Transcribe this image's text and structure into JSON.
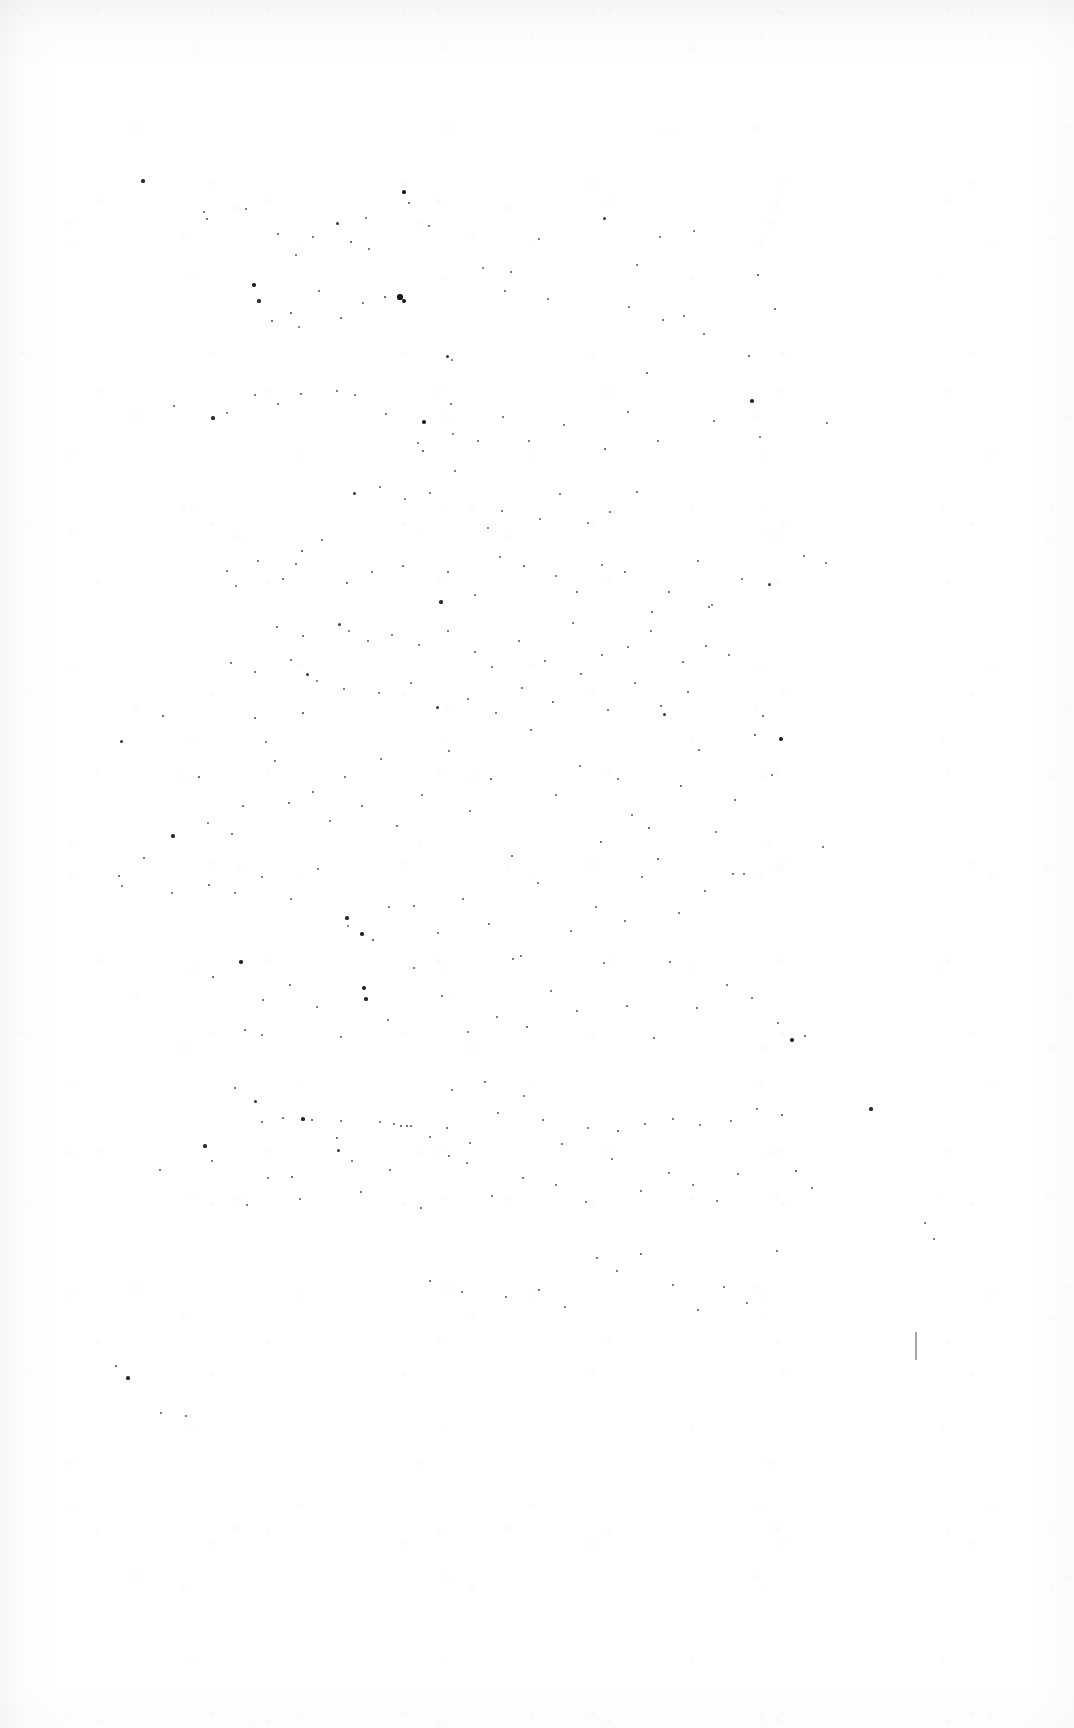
{
  "document": {
    "kind": "scanned-page",
    "title": "Blank scanned page",
    "page_width": 1074,
    "page_height": 1728,
    "background_color": "#ffffff",
    "paper_tone_color": "#f7f7f8",
    "speck_color": "#1a1a1a",
    "visible_text": "",
    "body_text": "",
    "header_text": "",
    "footer_text": "",
    "page_number": "",
    "notes": "No legible printed text, headings, figures or captions are present in the pixels; only scanner dust specks and faint paper tone."
  },
  "artifacts": {
    "description": "Scattered dark dust / toner specks distributed over the page",
    "speck_count": 236,
    "faint_mark": {
      "text": "· ····",
      "x": 660,
      "y": 128
    },
    "edge_tick": {
      "x": 915,
      "y": 1332,
      "height": 28
    },
    "specks": [
      [
        143,
        181,
        2.6
      ],
      [
        204,
        212,
        2.0
      ],
      [
        207,
        219,
        2.0
      ],
      [
        246,
        209,
        1.8
      ],
      [
        278,
        234,
        1.5
      ],
      [
        296,
        255,
        1.5
      ],
      [
        313,
        237,
        1.8
      ],
      [
        337,
        223,
        2.4
      ],
      [
        351,
        242,
        2.2
      ],
      [
        366,
        218,
        1.6
      ],
      [
        369,
        249,
        1.5
      ],
      [
        404,
        192,
        3.0
      ],
      [
        409,
        203,
        2.0
      ],
      [
        429,
        226,
        1.4
      ],
      [
        483,
        268,
        1.7
      ],
      [
        511,
        272,
        2.0
      ],
      [
        539,
        239,
        1.4
      ],
      [
        604,
        218,
        2.4
      ],
      [
        637,
        265,
        1.8
      ],
      [
        660,
        237,
        1.4
      ],
      [
        694,
        231,
        1.6
      ],
      [
        758,
        275,
        2.3
      ],
      [
        775,
        309,
        2.0
      ],
      [
        254,
        285,
        2.8
      ],
      [
        259,
        301,
        2.6
      ],
      [
        272,
        321,
        2.0
      ],
      [
        291,
        313,
        2.2
      ],
      [
        299,
        327,
        1.6
      ],
      [
        319,
        291,
        1.5
      ],
      [
        341,
        318,
        2.0
      ],
      [
        363,
        303,
        1.5
      ],
      [
        385,
        297,
        2.2
      ],
      [
        400,
        297,
        4.2
      ],
      [
        404,
        301,
        3.4
      ],
      [
        447,
        356,
        2.4
      ],
      [
        452,
        360,
        1.6
      ],
      [
        505,
        291,
        1.5
      ],
      [
        548,
        299,
        1.5
      ],
      [
        629,
        307,
        1.5
      ],
      [
        663,
        320,
        2.0
      ],
      [
        684,
        316,
        1.5
      ],
      [
        704,
        334,
        1.5
      ],
      [
        749,
        356,
        2.0
      ],
      [
        647,
        373,
        2.0
      ],
      [
        174,
        406,
        1.8
      ],
      [
        213,
        418,
        2.6
      ],
      [
        227,
        413,
        1.6
      ],
      [
        255,
        395,
        1.5
      ],
      [
        278,
        404,
        1.5
      ],
      [
        301,
        394,
        1.5
      ],
      [
        337,
        391,
        1.5
      ],
      [
        355,
        395,
        1.4
      ],
      [
        386,
        414,
        1.4
      ],
      [
        424,
        422,
        2.8
      ],
      [
        418,
        443,
        1.8
      ],
      [
        423,
        451,
        2.2
      ],
      [
        451,
        404,
        1.5
      ],
      [
        453,
        434,
        1.6
      ],
      [
        478,
        441,
        1.5
      ],
      [
        503,
        417,
        1.5
      ],
      [
        529,
        441,
        1.5
      ],
      [
        564,
        425,
        1.5
      ],
      [
        605,
        449,
        2.0
      ],
      [
        628,
        412,
        1.5
      ],
      [
        658,
        441,
        1.5
      ],
      [
        714,
        421,
        2.0
      ],
      [
        752,
        401,
        2.8
      ],
      [
        760,
        437,
        1.6
      ],
      [
        827,
        423,
        1.5
      ],
      [
        354,
        493,
        2.4
      ],
      [
        380,
        487,
        1.5
      ],
      [
        405,
        499,
        1.6
      ],
      [
        430,
        493,
        2.0
      ],
      [
        455,
        471,
        1.5
      ],
      [
        488,
        528,
        1.8
      ],
      [
        502,
        511,
        1.5
      ],
      [
        540,
        519,
        1.4
      ],
      [
        560,
        494,
        1.5
      ],
      [
        588,
        523,
        1.4
      ],
      [
        610,
        512,
        1.5
      ],
      [
        637,
        492,
        1.5
      ],
      [
        302,
        551,
        2.2
      ],
      [
        322,
        540,
        1.5
      ],
      [
        227,
        571,
        1.8
      ],
      [
        236,
        586,
        1.6
      ],
      [
        258,
        561,
        1.5
      ],
      [
        283,
        579,
        2.0
      ],
      [
        296,
        564,
        1.5
      ],
      [
        347,
        583,
        2.0
      ],
      [
        372,
        572,
        1.5
      ],
      [
        403,
        566,
        1.5
      ],
      [
        441,
        602,
        2.6
      ],
      [
        448,
        572,
        1.5
      ],
      [
        475,
        595,
        1.5
      ],
      [
        500,
        557,
        1.5
      ],
      [
        524,
        566,
        2.2
      ],
      [
        556,
        576,
        1.5
      ],
      [
        577,
        592,
        1.5
      ],
      [
        602,
        565,
        1.5
      ],
      [
        625,
        572,
        1.5
      ],
      [
        652,
        612,
        2.2
      ],
      [
        669,
        592,
        1.5
      ],
      [
        698,
        561,
        1.5
      ],
      [
        709,
        607,
        2.0
      ],
      [
        712,
        605,
        1.6
      ],
      [
        742,
        579,
        1.5
      ],
      [
        769,
        584,
        2.4
      ],
      [
        804,
        556,
        1.5
      ],
      [
        826,
        563,
        1.5
      ],
      [
        277,
        627,
        2.0
      ],
      [
        303,
        636,
        2.0
      ],
      [
        339,
        624,
        2.4
      ],
      [
        349,
        631,
        1.6
      ],
      [
        368,
        641,
        1.5
      ],
      [
        392,
        635,
        1.5
      ],
      [
        419,
        645,
        1.5
      ],
      [
        448,
        631,
        1.5
      ],
      [
        475,
        652,
        1.5
      ],
      [
        492,
        667,
        1.5
      ],
      [
        519,
        641,
        1.5
      ],
      [
        545,
        661,
        1.5
      ],
      [
        573,
        623,
        1.5
      ],
      [
        602,
        655,
        1.5
      ],
      [
        628,
        647,
        1.5
      ],
      [
        651,
        631,
        1.5
      ],
      [
        683,
        662,
        1.5
      ],
      [
        706,
        646,
        1.5
      ],
      [
        729,
        655,
        1.5
      ],
      [
        231,
        663,
        2.0
      ],
      [
        255,
        672,
        1.6
      ],
      [
        291,
        660,
        1.5
      ],
      [
        307,
        674,
        2.4
      ],
      [
        317,
        681,
        1.6
      ],
      [
        344,
        689,
        1.5
      ],
      [
        379,
        693,
        1.5
      ],
      [
        411,
        683,
        1.5
      ],
      [
        437,
        707,
        2.4
      ],
      [
        468,
        699,
        1.5
      ],
      [
        496,
        713,
        1.5
      ],
      [
        522,
        688,
        1.5
      ],
      [
        553,
        702,
        1.5
      ],
      [
        581,
        674,
        1.5
      ],
      [
        608,
        710,
        1.5
      ],
      [
        635,
        683,
        1.5
      ],
      [
        661,
        706,
        2.0
      ],
      [
        688,
        692,
        1.5
      ],
      [
        121,
        741,
        2.4
      ],
      [
        163,
        716,
        2.2
      ],
      [
        173,
        836,
        2.6
      ],
      [
        199,
        777,
        2.2
      ],
      [
        208,
        823,
        1.6
      ],
      [
        232,
        834,
        2.0
      ],
      [
        243,
        806,
        1.5
      ],
      [
        255,
        718,
        2.0
      ],
      [
        266,
        742,
        1.6
      ],
      [
        275,
        761,
        1.5
      ],
      [
        289,
        803,
        2.0
      ],
      [
        303,
        713,
        2.2
      ],
      [
        313,
        792,
        1.5
      ],
      [
        330,
        821,
        1.6
      ],
      [
        345,
        777,
        1.5
      ],
      [
        362,
        806,
        1.5
      ],
      [
        381,
        759,
        1.5
      ],
      [
        397,
        826,
        1.5
      ],
      [
        422,
        795,
        1.5
      ],
      [
        449,
        751,
        1.5
      ],
      [
        470,
        811,
        1.5
      ],
      [
        491,
        779,
        2.2
      ],
      [
        512,
        856,
        2.0
      ],
      [
        531,
        730,
        1.5
      ],
      [
        556,
        795,
        1.5
      ],
      [
        580,
        766,
        1.5
      ],
      [
        601,
        842,
        1.5
      ],
      [
        618,
        779,
        2.0
      ],
      [
        632,
        815,
        1.5
      ],
      [
        649,
        828,
        2.2
      ],
      [
        664,
        714,
        2.4
      ],
      [
        681,
        786,
        1.5
      ],
      [
        699,
        750,
        1.5
      ],
      [
        716,
        832,
        1.5
      ],
      [
        735,
        800,
        1.5
      ],
      [
        755,
        735,
        2.2
      ],
      [
        763,
        716,
        2.0
      ],
      [
        772,
        775,
        1.5
      ],
      [
        781,
        739,
        3.4
      ],
      [
        823,
        847,
        1.5
      ],
      [
        119,
        876,
        2.0
      ],
      [
        122,
        886,
        1.6
      ],
      [
        144,
        858,
        2.0
      ],
      [
        172,
        893,
        1.5
      ],
      [
        209,
        885,
        2.0
      ],
      [
        235,
        893,
        1.5
      ],
      [
        262,
        877,
        1.5
      ],
      [
        291,
        899,
        1.5
      ],
      [
        318,
        869,
        1.5
      ],
      [
        347,
        918,
        2.6
      ],
      [
        362,
        934,
        2.8
      ],
      [
        373,
        940,
        2.2
      ],
      [
        348,
        926,
        1.6
      ],
      [
        389,
        907,
        1.5
      ],
      [
        414,
        906,
        1.5
      ],
      [
        438,
        933,
        1.5
      ],
      [
        463,
        899,
        1.5
      ],
      [
        489,
        924,
        1.5
      ],
      [
        513,
        959,
        2.0
      ],
      [
        538,
        883,
        1.5
      ],
      [
        571,
        931,
        1.5
      ],
      [
        596,
        907,
        1.5
      ],
      [
        625,
        921,
        1.5
      ],
      [
        642,
        877,
        1.5
      ],
      [
        658,
        859,
        2.2
      ],
      [
        679,
        913,
        1.5
      ],
      [
        705,
        891,
        1.5
      ],
      [
        733,
        874,
        1.5
      ],
      [
        744,
        874,
        1.5
      ],
      [
        213,
        977,
        2.0
      ],
      [
        241,
        962,
        2.8
      ],
      [
        263,
        1000,
        2.0
      ],
      [
        245,
        1030,
        2.0
      ],
      [
        262,
        1035,
        1.6
      ],
      [
        290,
        985,
        2.0
      ],
      [
        317,
        1007,
        1.5
      ],
      [
        341,
        1037,
        1.5
      ],
      [
        364,
        988,
        3.4
      ],
      [
        366,
        999,
        2.6
      ],
      [
        388,
        1020,
        1.5
      ],
      [
        414,
        968,
        1.5
      ],
      [
        442,
        996,
        1.5
      ],
      [
        468,
        1032,
        1.5
      ],
      [
        497,
        1017,
        1.5
      ],
      [
        521,
        956,
        1.5
      ],
      [
        527,
        1027,
        2.0
      ],
      [
        551,
        991,
        1.5
      ],
      [
        577,
        1011,
        1.5
      ],
      [
        604,
        963,
        1.5
      ],
      [
        627,
        1006,
        1.5
      ],
      [
        654,
        1038,
        1.5
      ],
      [
        670,
        962,
        1.5
      ],
      [
        697,
        1008,
        1.5
      ],
      [
        727,
        985,
        1.5
      ],
      [
        752,
        998,
        1.5
      ],
      [
        778,
        1023,
        1.5
      ],
      [
        792,
        1040,
        2.8
      ],
      [
        805,
        1036,
        2.0
      ],
      [
        205,
        1146,
        2.6
      ],
      [
        235,
        1088,
        1.8
      ],
      [
        255,
        1101,
        2.4
      ],
      [
        262,
        1122,
        1.5
      ],
      [
        283,
        1118,
        1.5
      ],
      [
        303,
        1119,
        2.6
      ],
      [
        312,
        1120,
        2.2
      ],
      [
        337,
        1138,
        1.5
      ],
      [
        341,
        1121,
        1.5
      ],
      [
        352,
        1161,
        1.5
      ],
      [
        380,
        1122,
        1.8
      ],
      [
        394,
        1124,
        1.5
      ],
      [
        401,
        1126,
        2.0
      ],
      [
        407,
        1126,
        2.2
      ],
      [
        411,
        1126,
        1.8
      ],
      [
        430,
        1137,
        1.5
      ],
      [
        447,
        1128,
        1.5
      ],
      [
        452,
        1090,
        1.5
      ],
      [
        470,
        1143,
        1.5
      ],
      [
        485,
        1082,
        1.5
      ],
      [
        498,
        1113,
        1.5
      ],
      [
        524,
        1096,
        1.5
      ],
      [
        543,
        1120,
        1.5
      ],
      [
        562,
        1144,
        1.5
      ],
      [
        588,
        1128,
        1.5
      ],
      [
        618,
        1131,
        2.2
      ],
      [
        645,
        1124,
        1.5
      ],
      [
        673,
        1119,
        1.5
      ],
      [
        700,
        1125,
        1.5
      ],
      [
        731,
        1121,
        1.5
      ],
      [
        757,
        1109,
        1.5
      ],
      [
        782,
        1115,
        2.2
      ],
      [
        796,
        1171,
        2.2
      ],
      [
        812,
        1188,
        1.5
      ],
      [
        871,
        1109,
        2.6
      ],
      [
        925,
        1223,
        1.8
      ],
      [
        934,
        1239,
        1.5
      ],
      [
        160,
        1170,
        2.0
      ],
      [
        212,
        1161,
        1.5
      ],
      [
        247,
        1205,
        1.5
      ],
      [
        268,
        1178,
        1.5
      ],
      [
        292,
        1177,
        2.2
      ],
      [
        300,
        1199,
        1.5
      ],
      [
        338,
        1150,
        2.4
      ],
      [
        361,
        1192,
        1.5
      ],
      [
        390,
        1170,
        1.5
      ],
      [
        421,
        1208,
        1.5
      ],
      [
        449,
        1156,
        1.5
      ],
      [
        467,
        1163,
        1.5
      ],
      [
        492,
        1196,
        1.5
      ],
      [
        523,
        1178,
        1.5
      ],
      [
        556,
        1185,
        1.5
      ],
      [
        586,
        1202,
        1.5
      ],
      [
        612,
        1159,
        1.5
      ],
      [
        641,
        1191,
        1.5
      ],
      [
        669,
        1173,
        1.5
      ],
      [
        693,
        1185,
        1.5
      ],
      [
        717,
        1201,
        1.5
      ],
      [
        738,
        1174,
        1.5
      ],
      [
        430,
        1281,
        2.0
      ],
      [
        462,
        1292,
        1.5
      ],
      [
        506,
        1297,
        1.5
      ],
      [
        539,
        1290,
        2.0
      ],
      [
        565,
        1307,
        1.5
      ],
      [
        597,
        1258,
        1.5
      ],
      [
        617,
        1271,
        1.5
      ],
      [
        641,
        1254,
        1.5
      ],
      [
        673,
        1285,
        1.5
      ],
      [
        698,
        1310,
        1.5
      ],
      [
        724,
        1287,
        1.5
      ],
      [
        747,
        1303,
        1.5
      ],
      [
        777,
        1251,
        1.5
      ],
      [
        116,
        1366,
        2.2
      ],
      [
        128,
        1378,
        2.6
      ],
      [
        161,
        1413,
        1.5
      ],
      [
        186,
        1416,
        1.5
      ]
    ]
  }
}
